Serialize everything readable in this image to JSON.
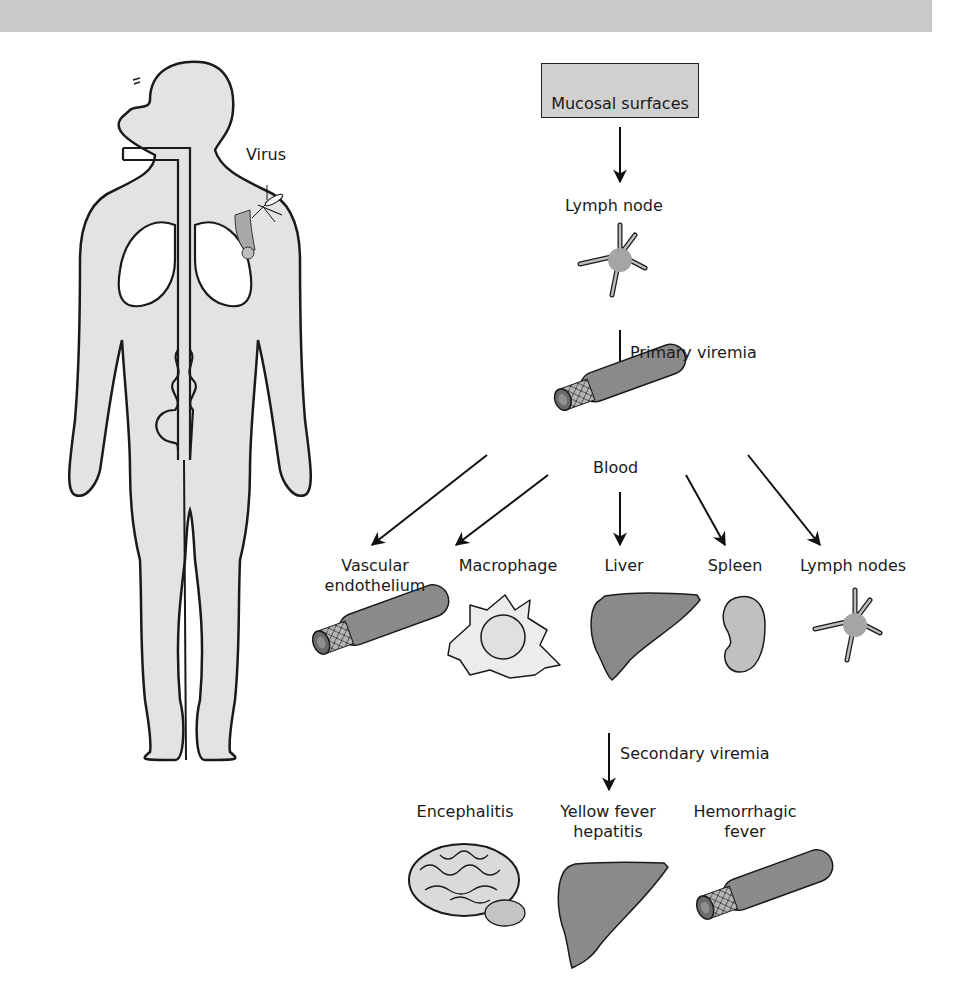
{
  "figure": {
    "colors": {
      "top_band": "#c9c9c9",
      "body_fill": "#e3e3e3",
      "organ_dark": "#8a8a8a",
      "organ_light": "#cfcfcf",
      "outline": "#1a1a1a"
    }
  },
  "body_figure": {
    "virus_label": "Virus"
  },
  "flow": {
    "entry": {
      "label": "Mucosal surfaces"
    },
    "first_site": {
      "label": "Lymph node"
    },
    "primary_arrow": {
      "label": "Primary viremia"
    },
    "blood": {
      "label": "Blood"
    },
    "targets": [
      {
        "label_line1": "Vascular",
        "label_line2": "endothelium"
      },
      {
        "label_line1": "Macrophage",
        "label_line2": ""
      },
      {
        "label_line1": "Liver",
        "label_line2": ""
      },
      {
        "label_line1": "Spleen",
        "label_line2": ""
      },
      {
        "label_line1": "Lymph nodes",
        "label_line2": ""
      }
    ],
    "secondary_arrow": {
      "label": "Secondary viremia"
    },
    "diseases": [
      {
        "label_line1": "Encephalitis",
        "label_line2": ""
      },
      {
        "label_line1": "Yellow fever",
        "label_line2": "hepatitis"
      },
      {
        "label_line1": "Hemorrhagic",
        "label_line2": "fever"
      }
    ]
  }
}
